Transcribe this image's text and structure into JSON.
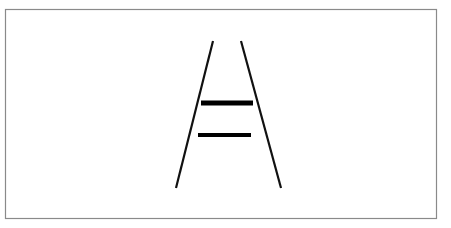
{
  "figure": {
    "title": "Schematic line drawing of converging road or runway with two transverse bars",
    "background_color": "#ffffff",
    "canvas": {
      "width": 451,
      "height": 228
    },
    "frame": {
      "label": "figure-border",
      "x": 5.5,
      "y": 9.5,
      "width": 431,
      "height": 209,
      "stroke_color": "#8a8a8a",
      "stroke_width": 1.2,
      "fill": "none"
    },
    "strokes": [
      {
        "name": "left-diagonal-line",
        "type": "line",
        "x1": 213,
        "y1": 41,
        "x2": 176,
        "y2": 188,
        "stroke_color": "#111111",
        "stroke_width": 2.2,
        "linecap": "butt"
      },
      {
        "name": "right-diagonal-line",
        "type": "line",
        "x1": 241,
        "y1": 41,
        "x2": 281,
        "y2": 188,
        "stroke_color": "#111111",
        "stroke_width": 2.2,
        "linecap": "butt"
      },
      {
        "name": "upper-crossbar",
        "type": "line",
        "x1": 201,
        "y1": 103,
        "x2": 253,
        "y2": 103,
        "stroke_color": "#000000",
        "stroke_width": 5,
        "linecap": "butt"
      },
      {
        "name": "lower-crossbar",
        "type": "line",
        "x1": 198,
        "y1": 135,
        "x2": 251,
        "y2": 135,
        "stroke_color": "#000000",
        "stroke_width": 4.2,
        "linecap": "butt"
      }
    ],
    "labels": []
  }
}
